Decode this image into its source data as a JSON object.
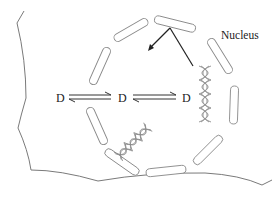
{
  "diagram": {
    "labels": {
      "nucleus": "Nucleus",
      "species": [
        "D",
        "D",
        "D"
      ]
    },
    "elements": {
      "cell_outline": "cell-membrane",
      "nuclear_envelope": "dashed-nuclear-envelope",
      "equilibria": [
        "reversible-arrow",
        "reversible-arrow"
      ],
      "dna": [
        "dna-helix-vertical",
        "dna-helix-diagonal"
      ],
      "pointer_arrows": 2
    },
    "colors": {
      "outline": "#7a7a7a",
      "text": "#222222",
      "arrow": "#222222"
    }
  }
}
